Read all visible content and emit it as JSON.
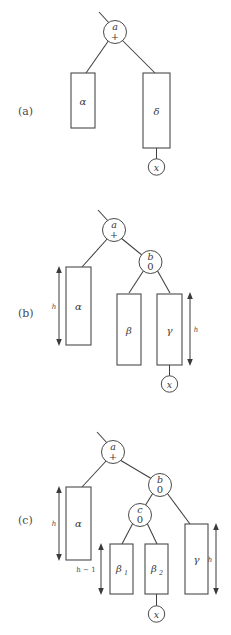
{
  "figure": {
    "background_color": "#ffffff",
    "line_color": "#4a4a4a",
    "text_color": "#3a3a3a"
  },
  "panels": [
    {
      "id": "a",
      "label": "(a)",
      "nodes": [
        {
          "name": "a",
          "balance": "+"
        },
        {
          "name": "x",
          "balance": ""
        }
      ],
      "subtrees": [
        {
          "label": "α",
          "height_label": ""
        },
        {
          "label": "δ",
          "height_label": ""
        }
      ],
      "height_markers": []
    },
    {
      "id": "b",
      "label": "(b)",
      "nodes": [
        {
          "name": "a",
          "balance": "+"
        },
        {
          "name": "b",
          "balance": "0"
        },
        {
          "name": "x",
          "balance": ""
        }
      ],
      "subtrees": [
        {
          "label": "α",
          "height_label": "h"
        },
        {
          "label": "β",
          "height_label": ""
        },
        {
          "label": "γ",
          "height_label": "h"
        }
      ],
      "height_markers": [
        "h",
        "h"
      ]
    },
    {
      "id": "c",
      "label": "(c)",
      "nodes": [
        {
          "name": "a",
          "balance": "+"
        },
        {
          "name": "b",
          "balance": "0"
        },
        {
          "name": "c",
          "balance": "0"
        },
        {
          "name": "x",
          "balance": ""
        }
      ],
      "subtrees": [
        {
          "label": "α",
          "height_label": "h"
        },
        {
          "label": "β",
          "index": "1",
          "height_label": "h − 1"
        },
        {
          "label": "β",
          "index": "2",
          "height_label": ""
        },
        {
          "label": "γ",
          "height_label": "h"
        }
      ],
      "height_markers": [
        "h",
        "h − 1",
        "h"
      ]
    }
  ],
  "glyphs": {
    "alpha": "α",
    "beta": "β",
    "gamma": "γ",
    "delta": "δ",
    "plus": "+",
    "zero": "0",
    "x": "x",
    "h": "h",
    "h_minus_1": "h − 1",
    "one": "1",
    "two": "2"
  }
}
